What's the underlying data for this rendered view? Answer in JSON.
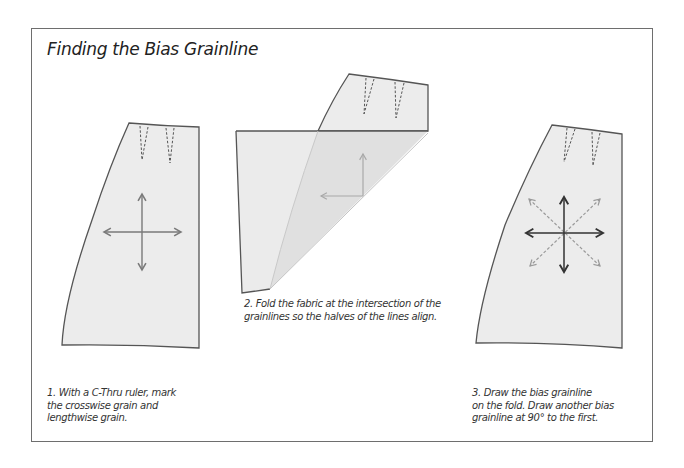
{
  "title": "Finding the Bias Grainline",
  "colors": {
    "frame": "#6e6e6e",
    "outline": "#555555",
    "fabric_fill": "#ececec",
    "fold_fill": "#e0e0e0",
    "grain_arrow_step1": "#7a7a7a",
    "grain_arrow_step3": "#333333",
    "bias_arrow_dashed": "#9a9a9a",
    "folded_arrow": "#a8a8a8"
  },
  "steps": [
    {
      "number": "1",
      "lines": [
        "1. With a C-Thru ruler, mark",
        "the crosswise grain and",
        "lengthwise grain."
      ],
      "figure": "skirt-with-grain-cross"
    },
    {
      "number": "2",
      "lines": [
        "2. Fold the fabric at  the intersection of the",
        "grainlines so the halves of the lines align."
      ],
      "figure": "skirt-folded-diagonally"
    },
    {
      "number": "3",
      "lines": [
        "3. Draw the bias grainline",
        "on the fold. Draw another bias",
        "grainline at 90° to the first."
      ],
      "figure": "skirt-with-bias-grainlines"
    }
  ]
}
